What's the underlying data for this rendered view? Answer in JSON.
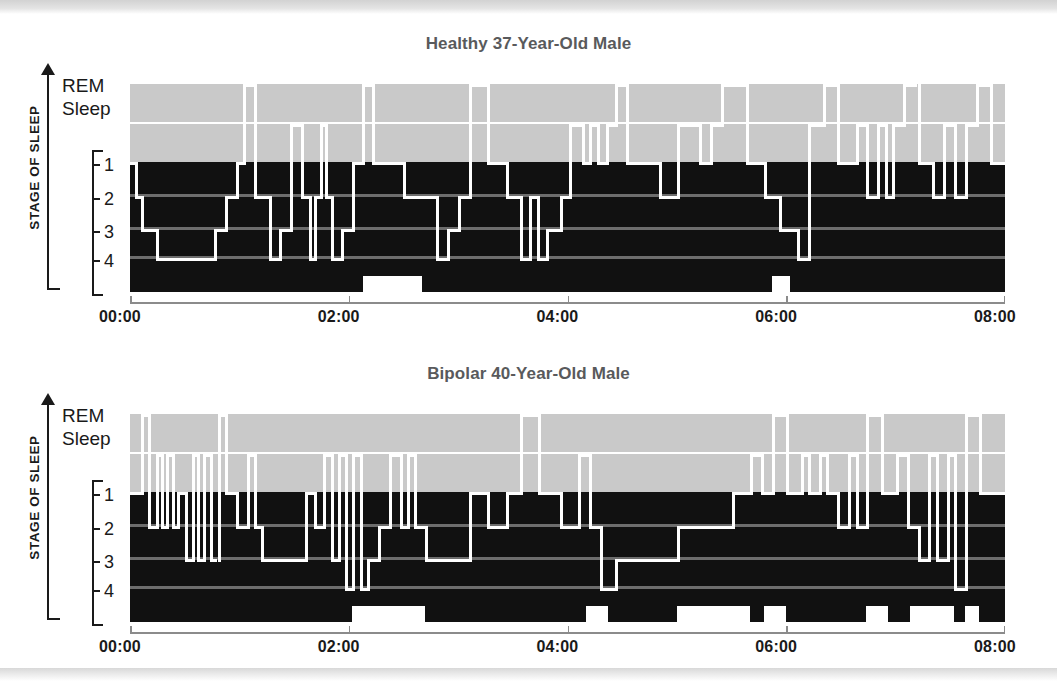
{
  "figure": {
    "y_axis_title": "STAGE OF SLEEP",
    "rem_label_line1": "REM",
    "rem_label_line2": "Sleep",
    "stage_ticks": [
      "1",
      "2",
      "3",
      "4"
    ],
    "x_tick_labels": [
      "00:00",
      "02:00",
      "04:00",
      "06:00",
      "08:00"
    ],
    "colors": {
      "awake_rem_band": "#c9c9c9",
      "sleep_band": "#111111",
      "trace": "#ffffff",
      "gridline": "#6d6d6d",
      "axis": "#8b8b8b",
      "title": "#595a5c",
      "text": "#1a1a1a"
    }
  },
  "chart_data": [
    {
      "type": "area",
      "title": "Healthy 37-Year-Old Male",
      "xlabel": "",
      "ylabel": "STAGE OF SLEEP",
      "xlim": [
        0,
        480
      ],
      "xticks": [
        0,
        120,
        240,
        360,
        480
      ],
      "xtick_labels": [
        "00:00",
        "02:00",
        "04:00",
        "06:00",
        "08:00"
      ],
      "ylevels": [
        "Awake",
        "REM",
        "1",
        "2",
        "3",
        "4"
      ],
      "grid": true,
      "legend": "none",
      "note": "Hypnogram: each segment is [start_minutes, end_minutes, stage]. stage 0=Awake(top), 1=REM, 2=Stage1, 3=Stage2, 4=Stage3, 5=Stage4",
      "segments": [
        [
          0,
          3,
          2
        ],
        [
          3,
          6,
          3
        ],
        [
          6,
          14,
          4
        ],
        [
          14,
          22,
          5
        ],
        [
          22,
          46,
          5
        ],
        [
          46,
          52,
          4
        ],
        [
          52,
          58,
          3
        ],
        [
          58,
          62,
          2
        ],
        [
          62,
          68,
          0
        ],
        [
          68,
          76,
          3
        ],
        [
          76,
          82,
          5
        ],
        [
          82,
          88,
          4
        ],
        [
          88,
          94,
          1
        ],
        [
          94,
          98,
          3
        ],
        [
          98,
          101,
          5
        ],
        [
          101,
          104,
          3
        ],
        [
          104,
          107,
          1
        ],
        [
          107,
          110,
          3
        ],
        [
          110,
          116,
          5
        ],
        [
          116,
          122,
          4
        ],
        [
          122,
          127,
          2
        ],
        [
          127,
          133,
          0
        ],
        [
          133,
          150,
          2
        ],
        [
          150,
          160,
          3
        ],
        [
          160,
          168,
          3
        ],
        [
          168,
          174,
          5
        ],
        [
          174,
          180,
          4
        ],
        [
          180,
          186,
          3
        ],
        [
          186,
          196,
          0
        ],
        [
          196,
          206,
          2
        ],
        [
          206,
          214,
          3
        ],
        [
          214,
          219,
          5
        ],
        [
          219,
          223,
          3
        ],
        [
          223,
          228,
          5
        ],
        [
          228,
          236,
          4
        ],
        [
          236,
          241,
          3
        ],
        [
          241,
          248,
          1
        ],
        [
          248,
          252,
          2
        ],
        [
          252,
          256,
          1
        ],
        [
          256,
          261,
          2
        ],
        [
          261,
          266,
          1
        ],
        [
          266,
          272,
          0
        ],
        [
          272,
          290,
          2
        ],
        [
          290,
          300,
          3
        ],
        [
          300,
          312,
          1
        ],
        [
          312,
          318,
          2
        ],
        [
          318,
          324,
          1
        ],
        [
          324,
          338,
          0
        ],
        [
          338,
          348,
          2
        ],
        [
          348,
          356,
          3
        ],
        [
          356,
          366,
          4
        ],
        [
          366,
          372,
          5
        ],
        [
          372,
          380,
          1
        ],
        [
          380,
          388,
          0
        ],
        [
          388,
          398,
          2
        ],
        [
          398,
          404,
          1
        ],
        [
          404,
          410,
          3
        ],
        [
          410,
          414,
          1
        ],
        [
          414,
          418,
          3
        ],
        [
          418,
          424,
          1
        ],
        [
          424,
          432,
          0
        ],
        [
          432,
          440,
          2
        ],
        [
          440,
          446,
          3
        ],
        [
          446,
          452,
          1
        ],
        [
          452,
          458,
          3
        ],
        [
          458,
          464,
          1
        ],
        [
          464,
          472,
          0
        ],
        [
          472,
          480,
          2
        ]
      ],
      "awake_out_of_bed": [
        [
          128,
          160
        ],
        [
          352,
          362
        ]
      ]
    },
    {
      "type": "area",
      "title": "Bipolar 40-Year-Old Male",
      "xlabel": "",
      "ylabel": "STAGE OF SLEEP",
      "xlim": [
        0,
        480
      ],
      "xticks": [
        0,
        120,
        240,
        360,
        480
      ],
      "xtick_labels": [
        "00:00",
        "02:00",
        "04:00",
        "06:00",
        "08:00"
      ],
      "ylevels": [
        "Awake",
        "REM",
        "1",
        "2",
        "3",
        "4"
      ],
      "grid": true,
      "legend": "none",
      "note": "Hypnogram: each segment is [start_minutes, end_minutes, stage]. stage 0=Awake(top), 1=REM, 2=Stage1, 3=Stage2, 4=Stage3, 5=Stage4",
      "segments": [
        [
          0,
          6,
          2
        ],
        [
          6,
          10,
          0
        ],
        [
          10,
          14,
          3
        ],
        [
          14,
          17,
          1
        ],
        [
          17,
          20,
          3
        ],
        [
          20,
          23,
          1
        ],
        [
          23,
          26,
          3
        ],
        [
          26,
          30,
          2
        ],
        [
          30,
          34,
          4
        ],
        [
          34,
          37,
          1
        ],
        [
          37,
          40,
          4
        ],
        [
          40,
          44,
          1
        ],
        [
          44,
          48,
          4
        ],
        [
          48,
          52,
          0
        ],
        [
          52,
          58,
          2
        ],
        [
          58,
          64,
          3
        ],
        [
          64,
          68,
          1
        ],
        [
          68,
          72,
          3
        ],
        [
          72,
          80,
          4
        ],
        [
          80,
          96,
          4
        ],
        [
          96,
          101,
          2
        ],
        [
          101,
          106,
          3
        ],
        [
          106,
          110,
          1
        ],
        [
          110,
          114,
          4
        ],
        [
          114,
          118,
          1
        ],
        [
          118,
          122,
          5
        ],
        [
          122,
          126,
          1
        ],
        [
          126,
          130,
          5
        ],
        [
          130,
          136,
          4
        ],
        [
          136,
          142,
          3
        ],
        [
          142,
          148,
          1
        ],
        [
          148,
          152,
          3
        ],
        [
          152,
          156,
          1
        ],
        [
          156,
          162,
          3
        ],
        [
          162,
          172,
          4
        ],
        [
          172,
          186,
          4
        ],
        [
          186,
          196,
          2
        ],
        [
          196,
          206,
          3
        ],
        [
          206,
          214,
          2
        ],
        [
          214,
          224,
          0
        ],
        [
          224,
          236,
          2
        ],
        [
          236,
          246,
          3
        ],
        [
          246,
          252,
          1
        ],
        [
          252,
          258,
          3
        ],
        [
          258,
          266,
          5
        ],
        [
          266,
          280,
          4
        ],
        [
          280,
          300,
          4
        ],
        [
          300,
          316,
          3
        ],
        [
          316,
          330,
          3
        ],
        [
          330,
          340,
          2
        ],
        [
          340,
          346,
          1
        ],
        [
          346,
          352,
          2
        ],
        [
          352,
          360,
          0
        ],
        [
          360,
          368,
          2
        ],
        [
          368,
          372,
          1
        ],
        [
          372,
          378,
          2
        ],
        [
          378,
          382,
          1
        ],
        [
          382,
          388,
          2
        ],
        [
          388,
          394,
          3
        ],
        [
          394,
          398,
          1
        ],
        [
          398,
          404,
          3
        ],
        [
          404,
          412,
          0
        ],
        [
          412,
          420,
          2
        ],
        [
          420,
          426,
          1
        ],
        [
          426,
          432,
          3
        ],
        [
          432,
          438,
          4
        ],
        [
          438,
          442,
          1
        ],
        [
          442,
          448,
          4
        ],
        [
          448,
          452,
          1
        ],
        [
          452,
          458,
          5
        ],
        [
          458,
          466,
          0
        ],
        [
          466,
          480,
          2
        ]
      ],
      "awake_out_of_bed": [
        [
          122,
          162
        ],
        [
          250,
          262
        ],
        [
          300,
          340
        ],
        [
          348,
          360
        ],
        [
          404,
          416
        ],
        [
          428,
          452
        ],
        [
          458,
          466
        ]
      ]
    }
  ]
}
